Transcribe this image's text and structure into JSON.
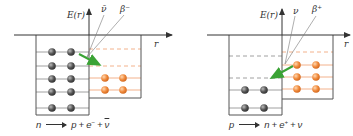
{
  "colors": {
    "axis": "#333333",
    "box": "#555555",
    "level_gray": "#888888",
    "level_orange": "#f0a070",
    "dashed_orange": "#f0a070",
    "dashed_gray": "#888888",
    "neutron": "#555555",
    "proton": "#f08a3c",
    "arrow": "#3aa335"
  },
  "panels": [
    {
      "id": "beta-minus",
      "axis_y_label": "E(r)",
      "axis_x_label": "r",
      "particle_labels": [
        "ν̄",
        "β⁻"
      ],
      "equation": {
        "lhs": "n",
        "rhs_1": "p",
        "plus": "+",
        "rhs_2": "e",
        "rhs_2_sup": "−",
        "rhs_3": "ν",
        "rhs_3_bar": true
      },
      "neutron_levels": 5,
      "proton_levels_filled": 2,
      "proton_levels_empty": 2
    },
    {
      "id": "beta-plus",
      "axis_y_label": "E(r)",
      "axis_x_label": "r",
      "particle_labels": [
        "ν",
        "β⁺"
      ],
      "equation": {
        "lhs": "p",
        "rhs_1": "n",
        "plus": "+",
        "rhs_2": "e",
        "rhs_2_sup": "+",
        "rhs_3": "ν",
        "rhs_3_bar": false
      },
      "neutron_levels_filled": 2,
      "neutron_levels_empty": 2,
      "proton_levels_filled": 3,
      "proton_levels_empty": 1
    }
  ]
}
